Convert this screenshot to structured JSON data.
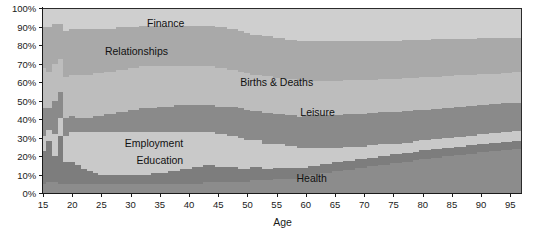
{
  "chart_data": {
    "type": "area",
    "subtype": "stacked-percentage",
    "title": "",
    "subtitle": "",
    "xlabel": "Age",
    "ylabel": "",
    "xlim": [
      15,
      97
    ],
    "ylim": [
      0,
      100
    ],
    "grid": false,
    "legend_position": "in-plot-labels",
    "x_tick_labels": [
      "15",
      "20",
      "25",
      "30",
      "35",
      "40",
      "45",
      "50",
      "55",
      "60",
      "65",
      "70",
      "75",
      "80",
      "85",
      "90",
      "95"
    ],
    "x_ticks": [
      15,
      20,
      25,
      30,
      35,
      40,
      45,
      50,
      55,
      60,
      65,
      70,
      75,
      80,
      85,
      90,
      95
    ],
    "y_tick_labels": [
      "0%",
      "10%",
      "20%",
      "30%",
      "40%",
      "50%",
      "60%",
      "70%",
      "80%",
      "90%",
      "100%"
    ],
    "y_ticks": [
      0,
      10,
      20,
      30,
      40,
      50,
      60,
      70,
      80,
      90,
      100
    ],
    "colors": {
      "health": "#8c8c8c",
      "education": "#7d7d7d",
      "employment": "#c9c9c9",
      "leisure": "#8a8a8a",
      "births_deaths": "#bdbdbd",
      "relationships": "#a9a9a9",
      "finance": "#cfcfcf",
      "axis": "#1a1a1a",
      "plot_border": "#2b2b2b",
      "label_text": "#111111"
    },
    "x": [
      15,
      16,
      17,
      18,
      19,
      20,
      21,
      22,
      23,
      24,
      25,
      26,
      27,
      28,
      29,
      30,
      31,
      32,
      33,
      34,
      35,
      36,
      37,
      38,
      39,
      40,
      41,
      42,
      43,
      44,
      45,
      46,
      47,
      48,
      49,
      50,
      51,
      52,
      53,
      54,
      55,
      56,
      57,
      58,
      59,
      60,
      61,
      62,
      63,
      64,
      65,
      66,
      67,
      68,
      69,
      70,
      71,
      72,
      73,
      74,
      75,
      76,
      77,
      78,
      79,
      80,
      81,
      82,
      83,
      84,
      85,
      86,
      87,
      88,
      89,
      90,
      91,
      92,
      93,
      94,
      95,
      96,
      97
    ],
    "series": [
      {
        "name": "Health",
        "label": "Health",
        "color": "#8c8c8c",
        "label_x": 61,
        "label_y": 8,
        "values": [
          5,
          6,
          6,
          5,
          5,
          5,
          5,
          5,
          5,
          5,
          5,
          5,
          5,
          5,
          5,
          5,
          5,
          5,
          5,
          5,
          5,
          5,
          5,
          5,
          5,
          5,
          5,
          5,
          6,
          6,
          6,
          6,
          6,
          6,
          6,
          6,
          7,
          7,
          7,
          7,
          8,
          8,
          8,
          8,
          9,
          9,
          10,
          10,
          11,
          11,
          12,
          12,
          13,
          13,
          14,
          14,
          15,
          15,
          16,
          16,
          17,
          17,
          18,
          18,
          19,
          20,
          20,
          21,
          21,
          22,
          22,
          23,
          23,
          24,
          24,
          25,
          25,
          26,
          26,
          27,
          27,
          28,
          28
        ]
      },
      {
        "name": "Education",
        "label": "Education",
        "color": "#7d7d7d",
        "label_x": 35,
        "label_y": 18,
        "values": [
          18,
          22,
          14,
          26,
          12,
          12,
          10,
          8,
          7,
          6,
          5,
          5,
          5,
          5,
          5,
          5,
          5,
          5,
          5,
          6,
          6,
          6,
          7,
          7,
          8,
          8,
          9,
          9,
          9,
          9,
          8,
          8,
          8,
          8,
          7,
          7,
          7,
          7,
          6,
          6,
          6,
          6,
          6,
          6,
          5,
          5,
          5,
          5,
          5,
          5,
          5,
          5,
          5,
          5,
          5,
          5,
          5,
          5,
          5,
          5,
          5,
          5,
          5,
          5,
          5,
          5,
          5,
          5,
          5,
          5,
          5,
          5,
          5,
          5,
          5,
          5,
          5,
          5,
          5,
          5,
          5,
          5,
          5
        ]
      },
      {
        "name": "Employment",
        "label": "Employment",
        "color": "#c9c9c9",
        "label_x": 34,
        "label_y": 27,
        "values": [
          8,
          6,
          12,
          10,
          14,
          16,
          18,
          20,
          21,
          22,
          23,
          23,
          23,
          23,
          23,
          23,
          23,
          23,
          23,
          22,
          22,
          22,
          21,
          21,
          20,
          20,
          19,
          19,
          18,
          18,
          18,
          18,
          17,
          17,
          17,
          16,
          15,
          15,
          14,
          14,
          13,
          13,
          12,
          12,
          11,
          11,
          10,
          10,
          9,
          9,
          8,
          8,
          8,
          8,
          7,
          7,
          7,
          7,
          7,
          7,
          6,
          6,
          6,
          6,
          6,
          6,
          6,
          6,
          6,
          6,
          6,
          6,
          6,
          6,
          6,
          6,
          6,
          6,
          6,
          6,
          6,
          6,
          6
        ]
      },
      {
        "name": "Leisure",
        "label": "Leisure",
        "color": "#8a8a8a",
        "label_x": 62,
        "label_y": 44,
        "values": [
          15,
          12,
          18,
          14,
          10,
          9,
          8,
          8,
          8,
          9,
          9,
          10,
          10,
          11,
          11,
          12,
          12,
          13,
          13,
          13,
          14,
          14,
          14,
          15,
          15,
          15,
          15,
          15,
          15,
          15,
          15,
          15,
          16,
          16,
          16,
          16,
          16,
          16,
          17,
          17,
          17,
          17,
          17,
          17,
          17,
          18,
          18,
          18,
          18,
          18,
          18,
          18,
          18,
          18,
          18,
          18,
          18,
          18,
          18,
          18,
          18,
          18,
          18,
          18,
          18,
          18,
          18,
          18,
          18,
          18,
          18,
          18,
          18,
          18,
          18,
          18,
          18,
          18,
          18,
          18,
          18,
          18,
          18
        ]
      },
      {
        "name": "Births & Deaths",
        "label": "Births & Deaths",
        "color": "#bdbdbd",
        "label_x": 55,
        "label_y": 60,
        "values": [
          22,
          20,
          20,
          18,
          22,
          22,
          23,
          23,
          23,
          23,
          23,
          23,
          23,
          23,
          23,
          23,
          23,
          23,
          23,
          23,
          22,
          22,
          22,
          21,
          21,
          21,
          21,
          21,
          21,
          21,
          21,
          21,
          20,
          20,
          20,
          20,
          20,
          20,
          20,
          20,
          20,
          20,
          20,
          20,
          20,
          19,
          19,
          19,
          19,
          19,
          19,
          19,
          19,
          19,
          19,
          19,
          19,
          19,
          19,
          19,
          19,
          19,
          19,
          19,
          19,
          19,
          19,
          19,
          19,
          19,
          19,
          19,
          19,
          19,
          19,
          19,
          19,
          19,
          19,
          19,
          19,
          19,
          19
        ]
      },
      {
        "name": "Relationships",
        "label": "Relationships",
        "color": "#a9a9a9",
        "label_x": 31,
        "label_y": 77,
        "values": [
          22,
          24,
          22,
          19,
          25,
          25,
          25,
          25,
          25,
          24,
          24,
          23,
          23,
          23,
          23,
          22,
          22,
          22,
          22,
          22,
          22,
          22,
          22,
          22,
          22,
          22,
          22,
          22,
          22,
          22,
          22,
          22,
          22,
          22,
          22,
          22,
          22,
          22,
          22,
          22,
          22,
          22,
          22,
          22,
          22,
          22,
          22,
          22,
          22,
          22,
          22,
          22,
          22,
          22,
          22,
          22,
          22,
          22,
          22,
          22,
          22,
          22,
          22,
          22,
          22,
          22,
          22,
          22,
          22,
          22,
          22,
          22,
          22,
          22,
          22,
          22,
          22,
          22,
          22,
          22,
          22,
          22,
          22
        ]
      },
      {
        "name": "Finance",
        "label": "Finance",
        "color": "#cfcfcf",
        "label_x": 36,
        "label_y": 92,
        "values": [
          10,
          10,
          8,
          8,
          12,
          11,
          11,
          11,
          11,
          11,
          11,
          11,
          11,
          10,
          10,
          10,
          10,
          9,
          9,
          9,
          9,
          9,
          9,
          9,
          9,
          9,
          9,
          9,
          9,
          9,
          10,
          10,
          11,
          11,
          12,
          13,
          14,
          14,
          15,
          15,
          16,
          16,
          17,
          17,
          18,
          18,
          18,
          18,
          18,
          18,
          18,
          18,
          18,
          18,
          18,
          18,
          18,
          18,
          18,
          18,
          18,
          18,
          18,
          18,
          18,
          18,
          18,
          18,
          18,
          18,
          18,
          18,
          18,
          18,
          18,
          18,
          18,
          18,
          18,
          18,
          18,
          18,
          18
        ]
      }
    ]
  }
}
